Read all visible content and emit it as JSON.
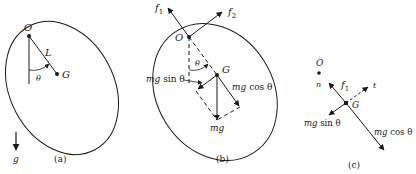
{
  "panels": [
    {
      "caption": "(a)",
      "labels": {
        "pivot": "O",
        "center": "G",
        "length": "L",
        "angle": "θ",
        "gravity": "g"
      }
    },
    {
      "caption": "(b)",
      "labels": {
        "pivot": "O",
        "center": "G",
        "angle": "θ",
        "force1": "f",
        "force1_sub": "1",
        "force2": "f",
        "force2_sub": "2",
        "weight": "mg",
        "sin_comp_mg": "mg",
        "sin_comp_fn": " sin θ",
        "cos_comp_mg": "mg",
        "cos_comp_fn": " cos θ"
      }
    },
    {
      "caption": "(c)",
      "labels": {
        "pivot": "O",
        "center": "G",
        "normal": "n",
        "tangent": "t",
        "force1": "f",
        "force1_sub": "1",
        "sin_comp_mg": "mg",
        "sin_comp_fn": " sin θ",
        "cos_comp_mg": "mg",
        "cos_comp_fn": " cos θ"
      }
    }
  ],
  "colors": {
    "ink": "#1a1a1a",
    "background": "#ffffff"
  }
}
